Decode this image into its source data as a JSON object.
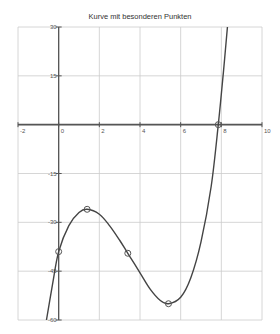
{
  "chart_data": {
    "type": "line",
    "title": "Kurve mit besonderen Punkten",
    "xlabel": "",
    "ylabel": "",
    "xlim": [
      -2,
      10
    ],
    "ylim": [
      -60,
      30
    ],
    "grid": true,
    "legend": null,
    "x_ticks": [
      -2,
      0,
      2,
      4,
      6,
      8,
      10
    ],
    "x_tick_labels": [
      "-2",
      "0",
      "2",
      "4",
      "6",
      "8",
      "10"
    ],
    "y_ticks": [
      30,
      15,
      -15,
      -30,
      -45,
      -60
    ],
    "y_tick_labels": [
      "30",
      "15",
      "-15",
      "-30",
      "-45",
      "-60"
    ],
    "y_gridlines": [
      30,
      15,
      0,
      -15,
      -30,
      -45,
      -60
    ],
    "series": [
      {
        "name": "Kurve",
        "x": [
          -0.6,
          -0.3,
          0,
          0.5,
          1.0,
          1.4,
          2.0,
          2.5,
          3.0,
          3.4,
          4.0,
          4.5,
          5.0,
          5.4,
          6.0,
          6.5,
          7.0,
          7.5,
          7.85,
          8.1,
          8.3
        ],
        "y": [
          -60,
          -49,
          -39,
          -31,
          -27,
          -26,
          -27.5,
          -31,
          -35.5,
          -39.5,
          -45.5,
          -50.5,
          -54,
          -55,
          -53,
          -47,
          -36,
          -19,
          0,
          16,
          30
        ]
      }
    ],
    "special_points": [
      {
        "label": "y-intercept",
        "x": 0,
        "y": -39
      },
      {
        "label": "local maximum",
        "x": 1.4,
        "y": -26
      },
      {
        "label": "inflection point",
        "x": 3.4,
        "y": -39.5
      },
      {
        "label": "local minimum",
        "x": 5.4,
        "y": -55
      },
      {
        "label": "root",
        "x": 7.85,
        "y": 0
      }
    ],
    "colors": {
      "curve": "#444444",
      "axis": "#555555",
      "grid": "#cccccc",
      "marker": "#555555"
    }
  }
}
